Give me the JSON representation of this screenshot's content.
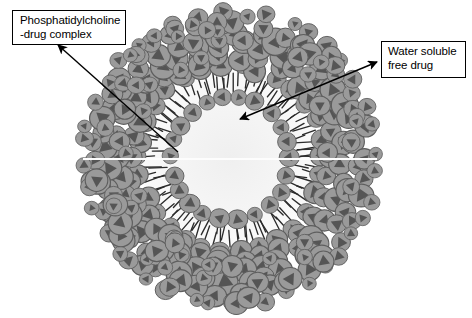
{
  "figure": {
    "background_color": "#ffffff",
    "width": 472,
    "height": 318
  },
  "callouts": [
    {
      "id": "phosphatidylcholine",
      "text": "Phosphatidylcholine\n-drug complex",
      "line1": "Phosphatidylcholine",
      "line2": "-drug complex",
      "box": {
        "x": 12,
        "y": 10,
        "width": 114,
        "height": 35
      },
      "arrow": {
        "from": {
          "x": 178,
          "y": 152
        },
        "to": {
          "x": 58,
          "y": 45
        },
        "heads": "single",
        "color": "#000000"
      }
    },
    {
      "id": "water-soluble-free-drug",
      "text": "Water soluble\nfree drug",
      "line1": "Water soluble",
      "line2": "free drug",
      "box": {
        "x": 381,
        "y": 41,
        "width": 85,
        "height": 37
      },
      "arrow": {
        "from": {
          "x": 240,
          "y": 119
        },
        "to": {
          "x": 377,
          "y": 62
        },
        "heads": "double",
        "color": "#000000"
      }
    }
  ],
  "vesicle": {
    "center": {
      "x": 230,
      "y": 158
    },
    "outer_radius": 147,
    "outer_shell": {
      "name": "phosphatidylcholine-drug-complex-shell",
      "description": "dense multilayer packing of circular head groups each containing a dark triangle",
      "inner_radius": 88,
      "outer_radius": 147,
      "head_fill": "#9a9a9a",
      "head_stroke": "#5e5e5e",
      "triangle_fill": "#555555",
      "head_radius_range": [
        7,
        15
      ],
      "ring_count": 5
    },
    "bilayer": {
      "name": "lipid-bilayer-tail-region",
      "outer_leaflet_radius": 92,
      "inner_leaflet_radius": 60,
      "tail_color": "#2b2b2b",
      "tail_region_fill": "#f2f2f2",
      "outer_leaflet_head_count": 30,
      "inner_leaflet_head_count": 22
    },
    "aqueous_core": {
      "name": "aqueous-core",
      "radius": 52,
      "gradient_center_color": "#ffffff",
      "gradient_edge_color": "#8f8f8f",
      "description": "water soluble free drug compartment"
    }
  },
  "artifacts": {
    "scanline": {
      "name": "horizontal-scan-artifact",
      "y": 159,
      "x_start": 83,
      "x_end": 377,
      "color": "#fdfdfd",
      "thickness": 2
    }
  },
  "colors": {
    "ink": "#000000",
    "paper": "#ffffff",
    "head_gray": "#9a9a9a",
    "triangle_gray": "#555555",
    "outline_gray": "#5e5e5e"
  }
}
